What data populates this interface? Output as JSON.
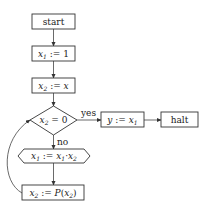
{
  "diagram": {
    "type": "flowchart",
    "nodes": {
      "start": {
        "label": "start",
        "shape": "rect"
      },
      "init_x1": {
        "var": "x",
        "sub": "1",
        "op": " := ",
        "rhs": "1",
        "shape": "rect"
      },
      "init_x2": {
        "var": "x",
        "sub": "2",
        "op": " := ",
        "rhs": "x",
        "shape": "rect"
      },
      "test": {
        "var": "x",
        "sub": "2",
        "op": " = ",
        "rhs": "0",
        "shape": "diamond"
      },
      "assign_y": {
        "var": "y",
        "op": " := ",
        "rhs_var": "x",
        "rhs_sub": "1",
        "shape": "rect"
      },
      "halt": {
        "label": "halt",
        "shape": "rect"
      },
      "mult": {
        "var": "x",
        "sub": "1",
        "op": " := ",
        "a": "x",
        "a_sub": "1",
        "dot": "·",
        "b": "x",
        "b_sub": "2",
        "shape": "hexagon"
      },
      "pred": {
        "var": "x",
        "sub": "2",
        "op": " := ",
        "fn": "P",
        "arg": "x",
        "arg_sub": "2",
        "shape": "rect"
      }
    },
    "edges": [
      {
        "from": "start",
        "to": "init_x1",
        "label": ""
      },
      {
        "from": "init_x1",
        "to": "init_x2",
        "label": ""
      },
      {
        "from": "init_x2",
        "to": "test",
        "label": ""
      },
      {
        "from": "test",
        "to": "assign_y",
        "label": "yes"
      },
      {
        "from": "assign_y",
        "to": "halt",
        "label": ""
      },
      {
        "from": "test",
        "to": "mult",
        "label": "no"
      },
      {
        "from": "mult",
        "to": "pred",
        "label": ""
      },
      {
        "from": "pred",
        "to": "test",
        "label": ""
      }
    ],
    "edge_labels": {
      "yes": "yes",
      "no": "no"
    }
  }
}
